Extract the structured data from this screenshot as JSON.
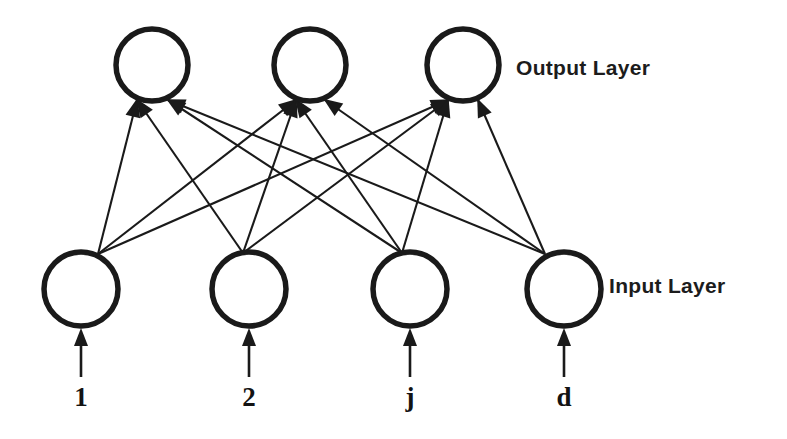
{
  "diagram": {
    "background_color": "#ffffff",
    "stroke_color": "#1a1a1a",
    "layers": [
      {
        "id": "output",
        "label": "Output Layer",
        "label_x": 516,
        "label_y": 75,
        "node_radius": 36,
        "node_center_y": 65,
        "nodes": [
          {
            "id": "out-1",
            "cx": 152,
            "cy": 65
          },
          {
            "id": "out-2",
            "cx": 310,
            "cy": 65
          },
          {
            "id": "out-3",
            "cx": 463,
            "cy": 65
          }
        ]
      },
      {
        "id": "input",
        "label": "Input Layer",
        "label_x": 609,
        "label_y": 293,
        "node_radius": 37,
        "node_center_y": 289,
        "nodes": [
          {
            "id": "in-1",
            "cx": 81,
            "cy": 289,
            "index_label": "1",
            "fan_x": 98,
            "fan_y": 254
          },
          {
            "id": "in-2",
            "cx": 249,
            "cy": 289,
            "index_label": "2",
            "fan_x": 243,
            "fan_y": 253
          },
          {
            "id": "in-3",
            "cx": 410,
            "cy": 289,
            "index_label": "j",
            "fan_x": 402,
            "fan_y": 253
          },
          {
            "id": "in-4",
            "cx": 564,
            "cy": 289,
            "index_label": "d",
            "fan_x": 545,
            "fan_y": 254
          }
        ]
      }
    ],
    "connections": {
      "description": "fully connected, 4 inputs x 3 outputs = 12 directed edges",
      "count": 12,
      "direction": "input-to-output",
      "targets": [
        {
          "out": "out-1",
          "left_port_x": 137,
          "right_port_x": 168,
          "port_y": 100
        },
        {
          "out": "out-2",
          "left_port_x": 296,
          "right_port_x": 325,
          "port_y": 100
        },
        {
          "out": "out-3",
          "left_port_x": 448,
          "right_port_x": 478,
          "port_y": 100
        }
      ],
      "edges": [
        {
          "from": "in-1",
          "to": "out-1",
          "port": "left"
        },
        {
          "from": "in-1",
          "to": "out-2",
          "port": "left"
        },
        {
          "from": "in-1",
          "to": "out-3",
          "port": "left"
        },
        {
          "from": "in-2",
          "to": "out-1",
          "port": "left"
        },
        {
          "from": "in-2",
          "to": "out-2",
          "port": "left"
        },
        {
          "from": "in-2",
          "to": "out-3",
          "port": "left"
        },
        {
          "from": "in-3",
          "to": "out-1",
          "port": "right"
        },
        {
          "from": "in-3",
          "to": "out-2",
          "port": "left"
        },
        {
          "from": "in-3",
          "to": "out-3",
          "port": "left"
        },
        {
          "from": "in-4",
          "to": "out-1",
          "port": "right"
        },
        {
          "from": "in-4",
          "to": "out-2",
          "port": "right"
        },
        {
          "from": "in-4",
          "to": "out-3",
          "port": "right"
        }
      ]
    },
    "input_stems": {
      "description": "vertical arrows entering each input node from below",
      "bottom_y": 377,
      "top_y": 330,
      "label_y": 406
    }
  }
}
